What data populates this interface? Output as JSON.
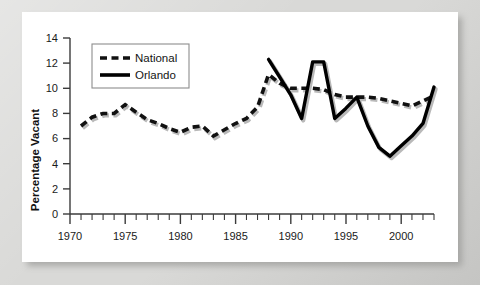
{
  "chart_data": {
    "type": "line",
    "title": "",
    "xlabel": "",
    "ylabel": "Percentage Vacant",
    "xlim": [
      1970,
      2003
    ],
    "ylim": [
      0,
      14
    ],
    "y_ticks": [
      0,
      2,
      4,
      6,
      8,
      10,
      12,
      14
    ],
    "x_ticks_major": [
      1970,
      1975,
      1980,
      1985,
      1990,
      1995,
      2000
    ],
    "x_tick_labels": [
      "1970",
      "1975",
      "1980",
      "1985",
      "1990",
      "1995",
      "2000"
    ],
    "y_tick_labels": [
      "0",
      "2",
      "4",
      "6",
      "8",
      "10",
      "12",
      "14"
    ],
    "x_minor_tick_step": 1,
    "grid": false,
    "legend_position": "upper-left",
    "series": [
      {
        "name": "National",
        "style": "dashed",
        "color": "#111111",
        "x": [
          1971,
          1972,
          1973,
          1974,
          1975,
          1976,
          1977,
          1978,
          1979,
          1980,
          1981,
          1982,
          1983,
          1984,
          1985,
          1986,
          1987,
          1988,
          1989,
          1990,
          1991,
          1992,
          1993,
          1994,
          1995,
          1996,
          1997,
          1998,
          1999,
          2000,
          2001,
          2002,
          2003
        ],
        "values": [
          7.0,
          7.7,
          8.0,
          8.0,
          8.7,
          8.1,
          7.5,
          7.2,
          6.8,
          6.5,
          6.9,
          7.0,
          6.2,
          6.7,
          7.2,
          7.6,
          8.5,
          11.1,
          10.4,
          10.0,
          10.0,
          10.0,
          9.9,
          9.5,
          9.3,
          9.3,
          9.3,
          9.2,
          9.0,
          8.8,
          8.6,
          9.0,
          9.4
        ]
      },
      {
        "name": "Orlando",
        "style": "solid",
        "color": "#000000",
        "x": [
          1988,
          1989,
          1990,
          1991,
          1992,
          1993,
          1994,
          1995,
          1996,
          1997,
          1998,
          1999,
          2000,
          2001,
          2002,
          2003
        ],
        "values": [
          12.3,
          10.9,
          9.5,
          7.6,
          12.1,
          12.1,
          7.6,
          8.4,
          9.3,
          7.0,
          5.3,
          4.6,
          5.4,
          6.2,
          7.2,
          10.1
        ]
      }
    ],
    "legend": [
      {
        "label": "National",
        "style": "dashed"
      },
      {
        "label": "Orlando",
        "style": "solid"
      }
    ]
  }
}
